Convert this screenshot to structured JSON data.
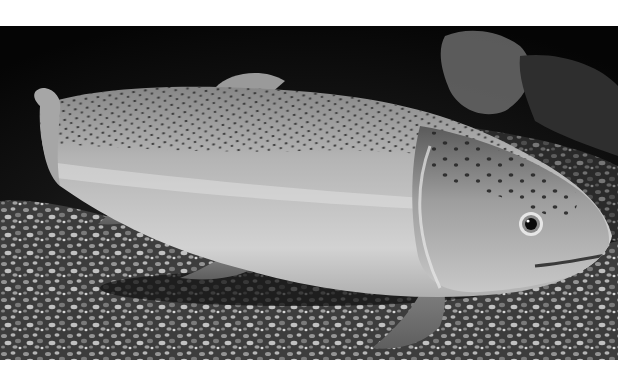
{
  "image": {
    "alt": "Black-and-white photograph of a spotted trout resting above gravel",
    "subject": "trout",
    "style": "grayscale",
    "background_color": "#ffffff",
    "photo_background": "#0a0a0a",
    "fish_body_color": "#b8b8b8",
    "fish_belly_color": "#d8d8d8",
    "fish_back_color": "#8a8a8a",
    "spot_color": "#2a2a2a",
    "gravel_color": "#6e6e6e"
  }
}
